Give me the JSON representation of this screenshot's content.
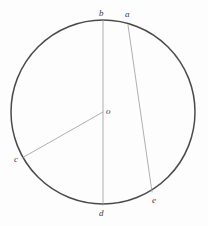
{
  "figure": {
    "name": "circle-with-chords",
    "background_color": "#fdfdfd",
    "circle_stroke_color": "#4a4a4a",
    "line_stroke_color": "#9a9a9a",
    "label_color": "#3b3b3b"
  },
  "chart_data": {
    "type": "diagram",
    "title": "",
    "subtitle": "",
    "xlabel": "",
    "ylabel": "",
    "geometry": "circle",
    "circle": {
      "center_label": "o",
      "center_x": 103,
      "center_y": 112,
      "radius": 92,
      "stroke_width": 1.5
    },
    "points": [
      {
        "label": "a",
        "x": 128,
        "y": 25,
        "on_circle": true
      },
      {
        "label": "b",
        "x": 103,
        "y": 20,
        "on_circle": true
      },
      {
        "label": "c",
        "x": 22,
        "y": 158,
        "on_circle": true
      },
      {
        "label": "d",
        "x": 103,
        "y": 205,
        "on_circle": true
      },
      {
        "label": "e",
        "x": 152,
        "y": 192,
        "on_circle": true
      },
      {
        "label": "o",
        "x": 103,
        "y": 112,
        "on_circle": false
      }
    ],
    "segments": [
      {
        "name": "diameter-bd",
        "from": "b",
        "to": "d",
        "x1": 103,
        "y1": 20,
        "x2": 103,
        "y2": 205,
        "stroke_width": 0.8
      },
      {
        "name": "chord-ae",
        "from": "a",
        "to": "e",
        "x1": 128,
        "y1": 25,
        "x2": 152,
        "y2": 192,
        "stroke_width": 0.8
      },
      {
        "name": "radius-oc",
        "from": "o",
        "to": "c",
        "x1": 103,
        "y1": 112,
        "x2": 22,
        "y2": 158,
        "stroke_width": 0.8
      }
    ],
    "labels": [
      {
        "text": "b",
        "left": 99,
        "top": 9
      },
      {
        "text": "a",
        "left": 125,
        "top": 10
      },
      {
        "text": "o",
        "left": 106,
        "top": 107
      },
      {
        "text": "c",
        "left": 14,
        "top": 155
      },
      {
        "text": "d",
        "left": 99,
        "top": 209
      },
      {
        "text": "e",
        "left": 152,
        "top": 196
      }
    ],
    "legend": [],
    "annotations": []
  }
}
